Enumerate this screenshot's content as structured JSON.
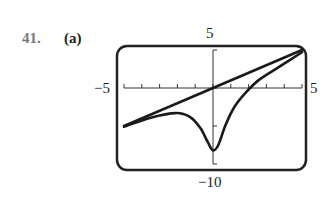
{
  "problem": {
    "number": "41.",
    "part": "(a)"
  },
  "chart_data": {
    "type": "line",
    "title": "",
    "xlim": [
      -5,
      5
    ],
    "ylim": [
      -10,
      5
    ],
    "tick_labels": {
      "x_min": "−5",
      "x_max": "5",
      "y_max": "5",
      "y_min": "−10"
    },
    "x_ticks": [
      -5,
      -4,
      -3,
      -2,
      -1,
      0,
      1,
      2,
      3,
      4,
      5
    ],
    "y_ticks": [
      5,
      0,
      -5,
      -10
    ],
    "grid": false,
    "series": [
      {
        "name": "line",
        "x": [
          -5,
          5
        ],
        "y": [
          -5,
          5
        ]
      },
      {
        "name": "curve",
        "x": [
          -5.0,
          -3.5,
          -2.1,
          -1.3,
          -0.7,
          -0.3,
          0.0,
          0.3,
          0.7,
          1.2,
          1.8,
          2.6,
          3.8,
          5.0
        ],
        "y": [
          -5.1,
          -3.9,
          -3.3,
          -3.8,
          -5.3,
          -7.1,
          -8.2,
          -7.5,
          -4.9,
          -2.5,
          -0.7,
          1.1,
          2.9,
          4.7
        ]
      }
    ]
  }
}
